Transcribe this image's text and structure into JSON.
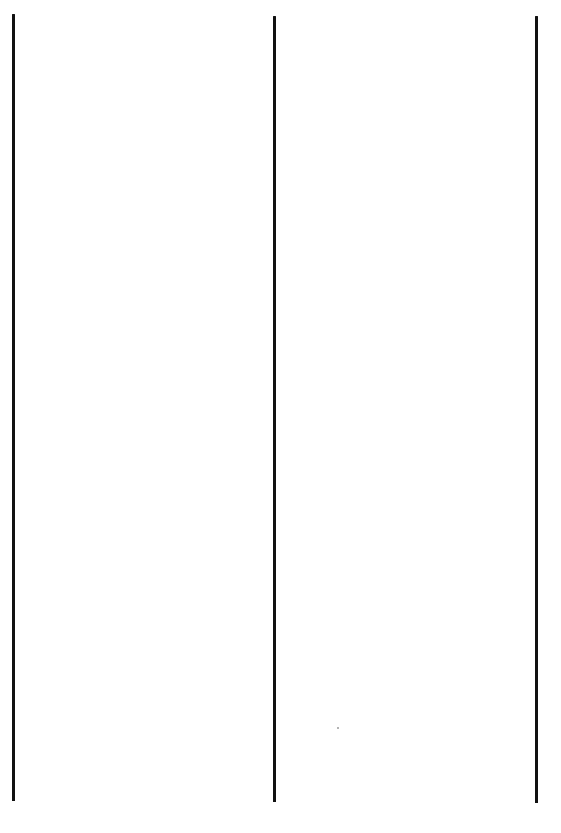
{
  "page": {
    "background": "#ffffff",
    "width": 561,
    "height": 833
  },
  "lines": [
    {
      "id": "left",
      "x": 12,
      "top": 14,
      "bottom": 801,
      "color": "#111111"
    },
    {
      "id": "middle",
      "x": 273,
      "top": 16,
      "bottom": 802,
      "color": "#111111"
    },
    {
      "id": "right",
      "x": 535,
      "top": 16,
      "bottom": 803,
      "color": "#111111"
    }
  ],
  "speck": {
    "x": 337,
    "y": 727,
    "color": "#9a9a9a"
  }
}
